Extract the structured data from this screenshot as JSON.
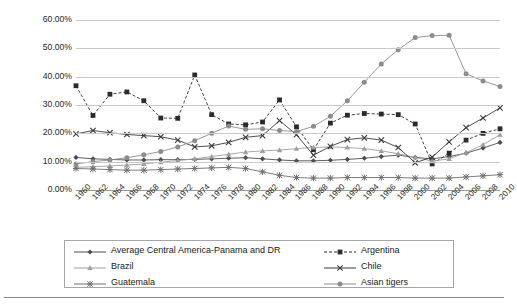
{
  "chart_data": {
    "type": "line",
    "title": "",
    "xlabel": "",
    "ylabel": "",
    "ylim": [
      0,
      60
    ],
    "ytick_format": "percent",
    "yticks": [
      "0.00%",
      "10.00%",
      "20.00%",
      "30.00%",
      "40.00%",
      "50.00%",
      "60.00%"
    ],
    "ytick_values": [
      0,
      10,
      20,
      30,
      40,
      50,
      60
    ],
    "grid": true,
    "legend_position": "bottom",
    "x": [
      1960,
      1962,
      1964,
      1966,
      1968,
      1970,
      1972,
      1974,
      1976,
      1978,
      1980,
      1982,
      1984,
      1986,
      1988,
      1990,
      1992,
      1994,
      1996,
      1998,
      2000,
      2002,
      2004,
      2006,
      2008,
      2010
    ],
    "xtick_labels": [
      "1960",
      "1962",
      "1964",
      "1966",
      "1968",
      "1970",
      "1972",
      "1974",
      "1976",
      "1978",
      "1980",
      "1982",
      "1984",
      "1986",
      "1988",
      "1990",
      "1992",
      "1994",
      "1996",
      "1998",
      "2000",
      "2002",
      "2004",
      "2006",
      "2008",
      "2010"
    ],
    "series": [
      {
        "name": "Average Central America-Panama and DR",
        "marker": "diamond",
        "color": "#4d4d4d",
        "dashed": false,
        "values": [
          11.5,
          11.0,
          10.8,
          10.6,
          10.6,
          10.7,
          10.7,
          10.8,
          11.0,
          11.2,
          11.4,
          11.0,
          10.6,
          10.3,
          10.3,
          10.5,
          10.8,
          11.2,
          11.8,
          12.3,
          11.5,
          11.0,
          11.8,
          13.0,
          14.8,
          16.8
        ]
      },
      {
        "name": "Argentina",
        "marker": "square",
        "color": "#2b2b2b",
        "dashed": true,
        "values": [
          36.8,
          26.3,
          33.8,
          34.6,
          31.5,
          25.4,
          25.3,
          40.6,
          26.6,
          23.3,
          23.0,
          24.0,
          31.8,
          22.3,
          14.2,
          23.6,
          26.4,
          27.0,
          26.8,
          26.6,
          23.3,
          9.2,
          13.0,
          17.6,
          20.0,
          21.6
        ]
      },
      {
        "name": "Brazil",
        "marker": "triangle",
        "color": "#9e9e9e",
        "dashed": false,
        "values": [
          8.0,
          8.2,
          8.5,
          8.8,
          9.2,
          9.8,
          10.4,
          11.0,
          11.8,
          12.6,
          13.4,
          13.8,
          14.1,
          14.6,
          15.0,
          15.2,
          15.0,
          14.6,
          13.8,
          12.8,
          11.5,
          10.2,
          11.0,
          13.2,
          16.0,
          19.5
        ]
      },
      {
        "name": "Chile",
        "marker": "x",
        "color": "#3a3a3a",
        "dashed": false,
        "values": [
          19.8,
          21.0,
          20.2,
          19.6,
          19.2,
          18.8,
          17.6,
          15.2,
          15.6,
          16.8,
          18.6,
          19.2,
          24.5,
          19.5,
          12.3,
          15.4,
          17.8,
          18.4,
          17.6,
          15.0,
          9.6,
          11.6,
          17.0,
          22.0,
          25.4,
          29.0
        ]
      },
      {
        "name": "Guatemala",
        "marker": "star",
        "color": "#6e6e6e",
        "dashed": false,
        "values": [
          7.6,
          7.4,
          7.2,
          7.0,
          7.0,
          7.2,
          7.4,
          7.6,
          7.8,
          8.0,
          7.6,
          6.4,
          5.2,
          4.4,
          4.2,
          4.2,
          4.4,
          4.4,
          4.4,
          4.4,
          4.2,
          4.2,
          4.2,
          4.6,
          5.0,
          5.4
        ]
      },
      {
        "name": "Asian tigers",
        "marker": "circle",
        "color": "#8c8c8c",
        "dashed": false,
        "values": [
          9.2,
          10.0,
          10.6,
          11.4,
          12.4,
          13.6,
          15.2,
          17.4,
          20.0,
          22.6,
          21.4,
          21.6,
          21.0,
          20.6,
          22.5,
          26.0,
          31.5,
          38.0,
          44.5,
          49.5,
          53.8,
          54.5,
          54.6,
          41.0,
          38.5,
          36.5
        ]
      }
    ]
  },
  "legend": {
    "entries": [
      {
        "label": "Average Central America-Panama and DR"
      },
      {
        "label": "Argentina"
      },
      {
        "label": "Brazil"
      },
      {
        "label": "Chile"
      },
      {
        "label": "Guatemala"
      },
      {
        "label": "Asian tigers"
      }
    ]
  }
}
